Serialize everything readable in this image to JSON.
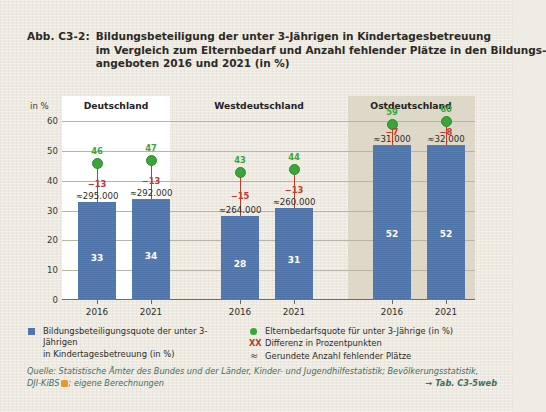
{
  "figure": {
    "number": "Abb. C3-2:",
    "title_lines": [
      "Bildungsbeteiligung der unter 3-Jährigen in Kindertagesbetreuung",
      "im Vergleich zum Elternbedarf und Anzahl fehlender Plätze in den Bildungs-",
      "angeboten 2016 und 2021 (in %)"
    ]
  },
  "axis": {
    "y_unit_label": "in %",
    "y_ticks": [
      "60",
      "50",
      "40",
      "30",
      "20",
      "10",
      "0"
    ],
    "y_min": 0,
    "y_max": 60,
    "y_step": 10
  },
  "legend": {
    "left": [
      {
        "marker": "blue-square",
        "line1": "Bildungsbeteiligungsquote der unter 3-Jährigen",
        "line2": "in Kindertagesbetreuung (in %)"
      }
    ],
    "right": [
      {
        "marker": "green-circle",
        "text": "Elternbedarfsquote für unter 3-Jährige (in %)"
      },
      {
        "marker": "xx-red",
        "marker_text": "XX",
        "text": "Differenz in Prozentpunkten"
      },
      {
        "marker": "approx",
        "marker_text": "≈",
        "text": "Gerundete Anzahl fehlender Plätze"
      }
    ]
  },
  "source": {
    "line1": "Quelle: Statistische Ämter des Bundes und der Länder, Kinder- und Jugendhilfestatistik; Bevölkerungsstatistik,",
    "line2_pre": "DJI-KiBS",
    "line2_post": "; eigene Berechnungen",
    "tab_ref": "→ Tab. C3-5web"
  },
  "colors": {
    "bar": "#4f76ad",
    "dot": "#3aa538",
    "diff": "#c0392b",
    "panel_highlight": "#ddd8c8",
    "panel_white": "#ffffff",
    "page": "#efece4",
    "source_text": "#3f6f5f",
    "kibs_icon": "#e8992e"
  },
  "chart_data": {
    "type": "bar",
    "xlabel": "",
    "ylabel": "in %",
    "ylim": [
      0,
      60
    ],
    "grid": true,
    "legend_position": "bottom",
    "groups": [
      {
        "name": "Deutschland",
        "highlight": false,
        "points": [
          {
            "year": "2016",
            "bar_value": 33,
            "dot_value": 46,
            "difference": "−13",
            "missing_places": "≈295.000"
          },
          {
            "year": "2021",
            "bar_value": 34,
            "dot_value": 47,
            "difference": "−13",
            "missing_places": "≈292.000"
          }
        ]
      },
      {
        "name": "Westdeutschland",
        "highlight": false,
        "points": [
          {
            "year": "2016",
            "bar_value": 28,
            "dot_value": 43,
            "difference": "−15",
            "missing_places": "≈264.000"
          },
          {
            "year": "2021",
            "bar_value": 31,
            "dot_value": 44,
            "difference": "−13",
            "missing_places": "≈260.000"
          }
        ]
      },
      {
        "name": "Ostdeutschland",
        "highlight": true,
        "points": [
          {
            "year": "2016",
            "bar_value": 52,
            "dot_value": 59,
            "difference": "−7",
            "missing_places": "≈31.000"
          },
          {
            "year": "2021",
            "bar_value": 52,
            "dot_value": 60,
            "difference": "−8",
            "missing_places": "≈32.000"
          }
        ]
      }
    ],
    "series": [
      {
        "name": "Bildungsbeteiligungsquote der unter 3-Jährigen in Kindertagesbetreuung (in %)",
        "values": [
          33,
          34,
          28,
          31,
          52,
          52
        ]
      },
      {
        "name": "Elternbedarfsquote für unter 3-Jährige (in %)",
        "values": [
          46,
          47,
          43,
          44,
          59,
          60
        ]
      }
    ],
    "categories": [
      "Deutschland 2016",
      "Deutschland 2021",
      "Westdeutschland 2016",
      "Westdeutschland 2021",
      "Ostdeutschland 2016",
      "Ostdeutschland 2021"
    ]
  }
}
